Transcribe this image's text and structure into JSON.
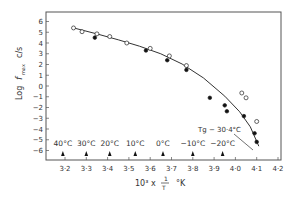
{
  "chart_data": {
    "type": "scatter",
    "title": "",
    "xlabel": "10³ x 1/T °K",
    "ylabel": "Log f max c/s",
    "xlim": [
      3.11,
      4.21
    ],
    "ylim": [
      -7,
      7
    ],
    "grid": false,
    "x_ticks": [
      "3·2",
      "3·3",
      "3·4",
      "3·5",
      "3·6",
      "3·7",
      "3·8",
      "3·9",
      "4·0",
      "4·1",
      "4·2"
    ],
    "x_tick_values": [
      3.2,
      3.3,
      3.4,
      3.5,
      3.6,
      3.7,
      3.8,
      3.9,
      4.0,
      4.1,
      4.2
    ],
    "y_ticks": [
      "6",
      "5",
      "4",
      "3",
      "2",
      "1",
      "0",
      "−1",
      "−2",
      "−3",
      "−4",
      "−5",
      "−6"
    ],
    "y_tick_values": [
      6,
      5,
      4,
      3,
      2,
      1,
      0,
      -1,
      -2,
      -3,
      -4,
      -5,
      -6
    ],
    "series": [
      {
        "name": "open circles",
        "marker": "open",
        "x": [
          3.24,
          3.28,
          3.35,
          3.41,
          3.49,
          3.6,
          3.69,
          3.77,
          4.03,
          4.05,
          4.1
        ],
        "y": [
          5.4,
          5.05,
          4.85,
          4.6,
          4.0,
          3.5,
          2.8,
          1.9,
          -0.65,
          -1.1,
          -3.3
        ]
      },
      {
        "name": "filled circles",
        "marker": "filled",
        "x": [
          3.34,
          3.58,
          3.68,
          3.77,
          3.88,
          3.95,
          3.96,
          4.04,
          4.09,
          4.1
        ],
        "y": [
          4.5,
          3.3,
          2.4,
          1.5,
          -1.1,
          -1.8,
          -2.35,
          -2.8,
          -4.4,
          -5.2
        ]
      }
    ],
    "fit_line": {
      "x": [
        3.24,
        3.35,
        3.45,
        3.55,
        3.65,
        3.75,
        3.85,
        3.95,
        4.02,
        4.07,
        4.11
      ],
      "y": [
        5.4,
        4.85,
        4.3,
        3.7,
        3.0,
        2.05,
        0.75,
        -0.95,
        -2.4,
        -3.8,
        -5.6
      ]
    },
    "annotations": [
      {
        "label": "40°C",
        "x": 3.19
      },
      {
        "label": "30°C",
        "x": 3.3
      },
      {
        "label": "20°C",
        "x": 3.41
      },
      {
        "label": "10°C",
        "x": 3.53
      },
      {
        "label": "0°C",
        "x": 3.66
      },
      {
        "label": "−10°C",
        "x": 3.8
      },
      {
        "label": "−20°C",
        "x": 3.94
      },
      {
        "label": "Tg − 30·4°C",
        "x": 4.11,
        "y": -6.0
      }
    ]
  },
  "labels": {
    "ylabel_log": "Log",
    "ylabel_f": "f",
    "ylabel_sub": "max",
    "ylabel_unit": "c/s",
    "xlabel_prefix": "10³ x",
    "xlabel_num": "1",
    "xlabel_den": "T",
    "xlabel_unit": "°K",
    "tg_label": "Tg − 30·4°C"
  }
}
